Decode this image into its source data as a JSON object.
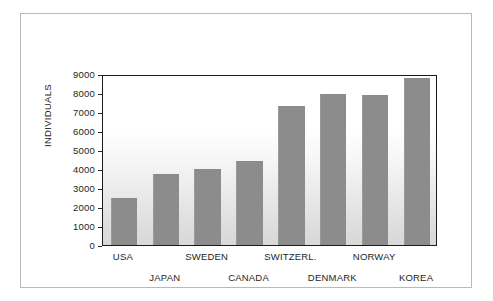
{
  "chart_data": {
    "type": "bar",
    "title": "",
    "xlabel": "",
    "ylabel": "INDIVIDUALS",
    "ylim": [
      0,
      9000
    ],
    "ytick_step": 1000,
    "yticks": [
      "9000",
      "8000",
      "7000",
      "6000",
      "5000",
      "4000",
      "3000",
      "2000",
      "1000",
      "0"
    ],
    "grid": false,
    "legend": false,
    "categories": [
      "USA",
      "JAPAN",
      "SWEDEN",
      "CANADA",
      "SWITZERL.",
      "DENMARK",
      "NORWAY",
      "KOREA"
    ],
    "values": [
      2500,
      3750,
      4000,
      4400,
      7300,
      7950,
      7900,
      8800
    ],
    "bar_color": "#8c8c8c",
    "plot_border_color": "#1b1b1b",
    "frame_color": "#b9b9b9",
    "background": "#ffffff",
    "label_rows": [
      0,
      1,
      0,
      1,
      0,
      1,
      0,
      1
    ]
  }
}
